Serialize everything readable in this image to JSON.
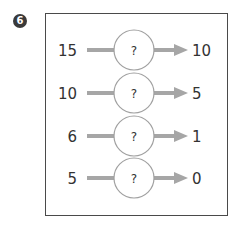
{
  "problem": {
    "number": "6",
    "rows": [
      {
        "input": "15",
        "operator": "?",
        "output": "10"
      },
      {
        "input": "10",
        "operator": "?",
        "output": "5"
      },
      {
        "input": "6",
        "operator": "?",
        "output": "1"
      },
      {
        "input": "5",
        "operator": "?",
        "output": "0"
      }
    ]
  },
  "colors": {
    "arrow": "#a6a6a6",
    "circle_stroke": "#a0a0a0",
    "text": "#333333",
    "badge": "#3a3a3a",
    "border": "#4a4a4a"
  }
}
